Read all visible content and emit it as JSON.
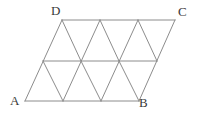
{
  "figure": {
    "name": "parallelogram-triangular-grid",
    "background_color": "#ffffff",
    "line_color": "#8c8c8c",
    "label_color": "#3a3a3a",
    "rows": 2,
    "columns": 3,
    "small_triangle_count": 12,
    "labels": {
      "a": "A",
      "b": "B",
      "c": "C",
      "d": "D"
    },
    "vertices": {
      "A": {
        "x": 25,
        "y": 101
      },
      "B": {
        "x": 139,
        "y": 101
      },
      "C": {
        "x": 175,
        "y": 20
      },
      "D": {
        "x": 62,
        "y": 20
      }
    },
    "lines": [
      {
        "name": "bottom-edge-AB",
        "x1": 25,
        "y1": 101,
        "x2": 139,
        "y2": 101
      },
      {
        "name": "middle-horizontal",
        "x1": 43,
        "y1": 61,
        "x2": 157,
        "y2": 61
      },
      {
        "name": "top-edge-DC",
        "x1": 62,
        "y1": 20,
        "x2": 175,
        "y2": 20
      },
      {
        "name": "left-edge-AD",
        "x1": 25,
        "y1": 101,
        "x2": 62,
        "y2": 20
      },
      {
        "name": "right-edge-BC",
        "x1": 139,
        "y1": 101,
        "x2": 175,
        "y2": 20
      },
      {
        "name": "diagonal-up-1",
        "x1": 63,
        "y1": 101,
        "x2": 100,
        "y2": 20
      },
      {
        "name": "diagonal-up-2",
        "x1": 101,
        "y1": 101,
        "x2": 138,
        "y2": 20
      },
      {
        "name": "diagonal-down-1",
        "x1": 43,
        "y1": 61,
        "x2": 63,
        "y2": 101
      },
      {
        "name": "diagonal-down-2",
        "x1": 62,
        "y1": 20,
        "x2": 81,
        "y2": 61
      },
      {
        "name": "diagonal-down-3",
        "x1": 81,
        "y1": 61,
        "x2": 101,
        "y2": 101
      },
      {
        "name": "diagonal-down-4",
        "x1": 100,
        "y1": 20,
        "x2": 119,
        "y2": 61
      },
      {
        "name": "diagonal-down-5",
        "x1": 119,
        "y1": 61,
        "x2": 139,
        "y2": 101
      },
      {
        "name": "diagonal-down-6",
        "x1": 138,
        "y1": 20,
        "x2": 157,
        "y2": 61
      }
    ]
  }
}
